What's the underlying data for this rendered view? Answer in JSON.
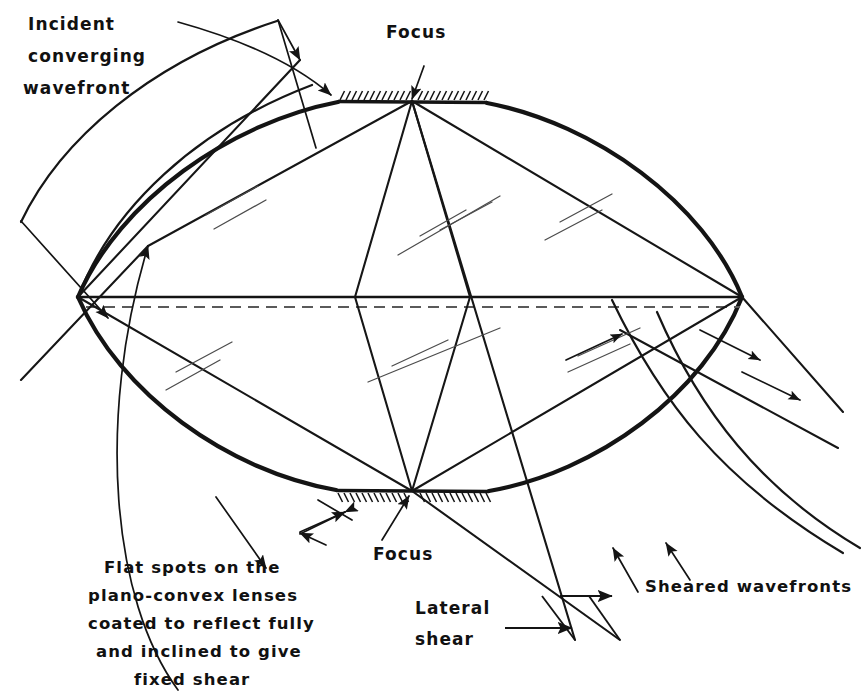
{
  "figure": {
    "width": 863,
    "height": 698,
    "background_color": "#ffffff",
    "ink_color": "#141414"
  },
  "labels": {
    "incident": {
      "line1": "Incident",
      "line2": "converging",
      "line3": "wavefront"
    },
    "focus_top": "Focus",
    "focus_bottom": "Focus",
    "lateral_shear": {
      "line1": "Lateral",
      "line2": "shear"
    },
    "sheared_wavefronts": "Sheared wavefronts",
    "flat_spots_caption": {
      "line1": "Flat spots on the",
      "line2": "plano-convex lenses",
      "line3": "coated to reflect fully",
      "line4": "and inclined to give",
      "line5": "fixed shear"
    }
  },
  "elements": {
    "lens_body": "biconvex-lens-outline",
    "optical_axis": "horizontal-optical-axis",
    "top_mirror": "top-flat-spot-mirror",
    "bottom_mirror": "bottom-flat-spot-mirror",
    "incident_wavefront_arcs": 2,
    "sheared_wavefront_arcs": 2,
    "ray_count_top_focus": 4,
    "ray_count_bottom_focus": 4
  },
  "geometry": {
    "lens_left_vertex": [
      78,
      297
    ],
    "lens_right_vertex": [
      742,
      297
    ],
    "top_focus": [
      412,
      101
    ],
    "bottom_focus": [
      412,
      491
    ],
    "top_mirror_span": [
      338,
      487
    ],
    "bottom_mirror_span": [
      336,
      489
    ],
    "axis_y": 297
  }
}
